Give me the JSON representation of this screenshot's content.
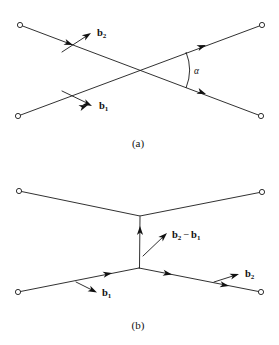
{
  "figure": {
    "background_color": "#ffffff",
    "ink_color": "#1a1a1a",
    "width": 279,
    "height": 345,
    "panels": [
      {
        "id": "panel-a",
        "caption": "(a)",
        "caption_pos": {
          "x": 138,
          "y": 147
        },
        "description": "Two straight lines crossing at a point, each carrying a direction arrow; the angle between the outgoing branches is alpha.",
        "nodes": [
          {
            "name": "node-a-top-left",
            "x": 20,
            "y": 25
          },
          {
            "name": "node-a-top-right",
            "x": 262,
            "y": 25
          },
          {
            "name": "node-a-bottom-left",
            "x": 18,
            "y": 116
          },
          {
            "name": "node-a-bottom-right",
            "x": 261,
            "y": 116
          }
        ],
        "vertex": {
          "name": "crossing-point",
          "x": 141,
          "y": 70
        },
        "segments": [
          {
            "name": "segment-b2-line",
            "x1": 20,
            "y1": 25,
            "x2": 261,
            "y2": 116
          },
          {
            "name": "segment-b1-line",
            "x1": 18,
            "y1": 116,
            "x2": 262,
            "y2": 25
          }
        ],
        "arrowheads": [
          {
            "name": "arrowhead-b2-upper-left",
            "x": 73,
            "y": 45,
            "angle_deg": 20.7
          },
          {
            "name": "arrowhead-b1-lower-left",
            "x": 88,
            "y": 105,
            "angle_deg": -20.5
          },
          {
            "name": "arrowhead-upper-right",
            "x": 206,
            "y": 45,
            "angle_deg": -20.5
          },
          {
            "name": "arrowhead-lower-right",
            "x": 206,
            "y": 94,
            "angle_deg": 20.7
          }
        ],
        "labels": [
          {
            "name": "label-b2",
            "base": "b",
            "sub": "2",
            "x": 97,
            "y": 36
          },
          {
            "name": "label-b1",
            "base": "b",
            "sub": "1",
            "x": 99,
            "y": 109
          }
        ],
        "leaders": [
          {
            "name": "leader-b2",
            "x1": 62,
            "y1": 52,
            "x2": 92,
            "y2": 33
          },
          {
            "name": "leader-b1",
            "x1": 62,
            "y1": 91,
            "x2": 93,
            "y2": 106
          }
        ],
        "angle": {
          "name": "angle-alpha",
          "symbol": "α",
          "label_x": 194,
          "label_y": 74,
          "arc_center_x": 141,
          "arc_center_y": 70,
          "arc_radius": 48
        }
      },
      {
        "id": "panel-b",
        "caption": "(b)",
        "caption_pos": {
          "x": 138,
          "y": 329
        },
        "description": "A Y-shaped / H-shaped graph: an upper wedge joined by a vertical link to a lower wedge, with vectors b1, b2 and the difference b2 minus b1.",
        "nodes": [
          {
            "name": "node-b-top-left",
            "x": 19,
            "y": 191
          },
          {
            "name": "node-b-top-right",
            "x": 262,
            "y": 192
          },
          {
            "name": "node-b-bottom-left",
            "x": 18,
            "y": 292
          },
          {
            "name": "node-b-bottom-right",
            "x": 261,
            "y": 292
          }
        ],
        "vertices": [
          {
            "name": "upper-vertex",
            "x": 140,
            "y": 216
          },
          {
            "name": "lower-vertex",
            "x": 139,
            "y": 268
          }
        ],
        "segments": [
          {
            "name": "segment-top-left-arm",
            "x1": 19,
            "y1": 191,
            "x2": 140,
            "y2": 216
          },
          {
            "name": "segment-top-right-arm",
            "x1": 262,
            "y1": 192,
            "x2": 140,
            "y2": 216
          },
          {
            "name": "segment-vertical-link",
            "x1": 139,
            "y1": 268,
            "x2": 140,
            "y2": 217
          },
          {
            "name": "segment-bottom-left-arm",
            "x1": 18,
            "y1": 292,
            "x2": 139,
            "y2": 268
          },
          {
            "name": "segment-bottom-right-arm",
            "x1": 139,
            "y1": 268,
            "x2": 261,
            "y2": 292
          }
        ],
        "arrowheads": [
          {
            "name": "arrowhead-vertical-up",
            "x": 140,
            "y": 227,
            "angle_deg": -90
          },
          {
            "name": "arrowhead-b1-left",
            "x": 111,
            "y": 273,
            "angle_deg": -11.2
          },
          {
            "name": "arrowhead-inner-right",
            "x": 172,
            "y": 274,
            "angle_deg": 11.2
          },
          {
            "name": "arrowhead-b2-right",
            "x": 229,
            "y": 285,
            "angle_deg": 11.2
          }
        ],
        "labels": [
          {
            "name": "label-b2-minus-b1",
            "base": "b",
            "sub": "2",
            "operator": "−",
            "base2": "b",
            "sub2": "1",
            "x": 172,
            "y": 238
          },
          {
            "name": "label-b1",
            "base": "b",
            "sub": "1",
            "x": 102,
            "y": 296
          },
          {
            "name": "label-b2",
            "base": "b",
            "sub": "2",
            "x": 245,
            "y": 277
          }
        ],
        "leaders": [
          {
            "name": "leader-b2-minus-b1",
            "x1": 143,
            "y1": 256,
            "x2": 167,
            "y2": 233
          },
          {
            "name": "leader-b1",
            "x1": 76,
            "y1": 282,
            "x2": 98,
            "y2": 293
          },
          {
            "name": "leader-b2",
            "x1": 214,
            "y1": 282,
            "x2": 240,
            "y2": 274
          }
        ]
      }
    ]
  }
}
